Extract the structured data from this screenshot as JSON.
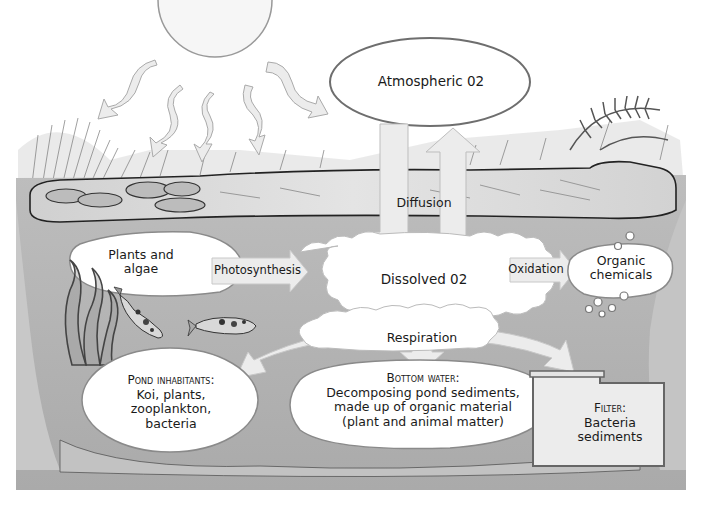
{
  "diagram": {
    "nodes": {
      "atmospheric": {
        "label": "Atmospheric 02"
      },
      "dissolved": {
        "label": "Dissolved 02"
      },
      "plants": {
        "label_line1": "Plants and",
        "label_line2": "algae"
      },
      "organic": {
        "label_line1": "Organic",
        "label_line2": "chemicals"
      },
      "pond_inhabitants": {
        "heading": "Pond inhabitants:",
        "line1": "Koi, plants,",
        "line2": "zooplankton,",
        "line3": "bacteria"
      },
      "bottom_water": {
        "heading": "Bottom water:",
        "line1": "Decomposing pond sediments,",
        "line2": "made up of organic material",
        "line3": "(plant and animal matter)"
      },
      "filter": {
        "heading": "Filter:",
        "line1": "Bacteria",
        "line2": "sediments"
      }
    },
    "processes": {
      "diffusion": "Diffusion",
      "photosynthesis": "Photosynthesis",
      "oxidation": "Oxidation",
      "respiration": "Respiration"
    },
    "edges": [
      {
        "from": "atmospheric",
        "to": "dissolved",
        "label": "Diffusion"
      },
      {
        "from": "dissolved",
        "to": "atmospheric",
        "label": "Diffusion"
      },
      {
        "from": "plants",
        "to": "dissolved",
        "label": "Photosynthesis"
      },
      {
        "from": "dissolved",
        "to": "organic",
        "label": "Oxidation"
      },
      {
        "from": "dissolved",
        "to": "pond_inhabitants",
        "label": "Respiration"
      },
      {
        "from": "dissolved",
        "to": "bottom_water",
        "label": "Respiration"
      },
      {
        "from": "dissolved",
        "to": "filter",
        "label": "Respiration"
      }
    ],
    "colors": {
      "water": "#b3b3b3",
      "bank": "#d6d6d6",
      "bubble_fill": "#ffffff",
      "outline": "#6e6e6e",
      "arrow": "#ececec",
      "text": "#1a1a1a"
    },
    "icons": [
      "sun-icon",
      "sun-ray-arrow-icon",
      "fish-icon",
      "seaweed-icon",
      "lily-pad-icon",
      "fern-icon",
      "bubble-icon"
    ]
  }
}
